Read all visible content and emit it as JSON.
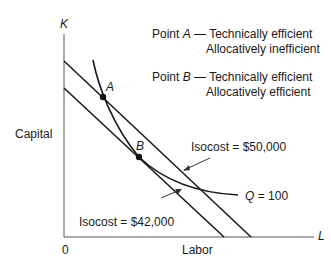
{
  "diagram": {
    "type": "isoquant-isocost",
    "axes": {
      "y_symbol": "K",
      "y_label": "Capital",
      "x_symbol": "L",
      "x_label": "Labor",
      "origin": "0"
    },
    "curves": {
      "isoquant": {
        "label_prefix": "Q",
        "label_value": "= 100"
      },
      "isocost_high": {
        "label": "Isocost = $50,000"
      },
      "isocost_low": {
        "label": "Isocost = $42,000"
      }
    },
    "points": [
      {
        "id": "A",
        "prefix": "Point ",
        "name": "A",
        "dash": " — ",
        "line1": "Technically efficient",
        "line2": "Allocatively inefficient"
      },
      {
        "id": "B",
        "prefix": "Point ",
        "name": "B",
        "dash": " — ",
        "line1": "Technically efficient",
        "line2": "Allocatively efficient"
      }
    ],
    "colors": {
      "ink": "#1a1a1a",
      "background": "#ffffff"
    }
  }
}
